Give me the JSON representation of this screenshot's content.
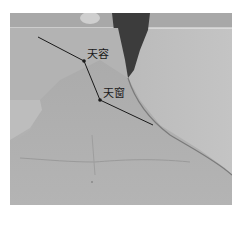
{
  "figure": {
    "points": [
      {
        "label": "天容",
        "x": 84,
        "y": 61
      },
      {
        "label": "天窗",
        "x": 100,
        "y": 100
      }
    ],
    "colors": {
      "background": "#b8b8b8",
      "skin": "#a9a9a9",
      "hair": "#3a3a3a",
      "line": "#1a1a1a"
    }
  }
}
